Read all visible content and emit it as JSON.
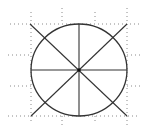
{
  "diagram": {
    "type": "circle-divided-into-sectors",
    "colors": {
      "background": "#ffffff",
      "stroke": "#333333",
      "grid": "#8a8a8a",
      "center_dot": "#111111"
    },
    "circle": {
      "cx": 79,
      "cy": 70,
      "rx": 48,
      "ry": 46
    },
    "center": {
      "x": 79,
      "y": 70
    },
    "sector_count": 8,
    "lines": [
      {
        "name": "vertical-diameter",
        "x1": 79,
        "y1": 24,
        "x2": 79,
        "y2": 116
      },
      {
        "name": "horizontal-diameter",
        "x1": 31,
        "y1": 70,
        "x2": 127,
        "y2": 70
      },
      {
        "name": "diagonal-tl-br",
        "x1": 30,
        "y1": 24,
        "x2": 127,
        "y2": 116
      },
      {
        "name": "diagonal-tr-bl",
        "x1": 127,
        "y1": 24,
        "x2": 31,
        "y2": 116
      }
    ],
    "grid_dotted": {
      "horizontal": [
        {
          "y": 24,
          "x1": 10,
          "x2": 140
        },
        {
          "y": 116,
          "x1": 8,
          "x2": 140
        },
        {
          "y": 55,
          "x1": 8,
          "x2": 31
        },
        {
          "y": 86,
          "x1": 10,
          "x2": 31
        },
        {
          "y": 55,
          "x1": 127,
          "x2": 140
        },
        {
          "y": 86,
          "x1": 127,
          "x2": 140
        }
      ],
      "vertical": [
        {
          "x": 31,
          "y1": 12,
          "y2": 124
        },
        {
          "x": 62,
          "y1": 8,
          "y2": 24
        },
        {
          "x": 62,
          "y1": 116,
          "y2": 128
        },
        {
          "x": 95,
          "y1": 12,
          "y2": 24
        },
        {
          "x": 95,
          "y1": 116,
          "y2": 122
        },
        {
          "x": 127,
          "y1": 8,
          "y2": 128
        }
      ]
    }
  }
}
